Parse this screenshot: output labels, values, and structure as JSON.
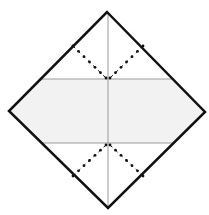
{
  "diagram": {
    "type": "origami-fold-step",
    "canvas": {
      "width": 209,
      "height": 215,
      "background": "#ffffff"
    },
    "paper": {
      "shape": "diamond",
      "corners": {
        "top": [
          107,
          12
        ],
        "right": [
          205,
          112
        ],
        "bottom": [
          108,
          208
        ],
        "left": [
          9,
          111
        ]
      },
      "outline_color": "#111111",
      "outline_width": 2.5,
      "fill_top": "#ffffff",
      "fill_band": "#f2f2f2",
      "fill_bottom": "#ffffff"
    },
    "creases": {
      "color": "#9a9a9a",
      "width": 1,
      "vertical": {
        "x": 108,
        "y1": 12,
        "y2": 208
      },
      "horizontal_top": {
        "y": 79,
        "x1": 41,
        "x2": 174
      },
      "horizontal_bottom": {
        "y": 143,
        "x1": 42,
        "x2": 174
      }
    },
    "valley_folds": {
      "color": "#111111",
      "style": "dot-dash",
      "lines": [
        {
          "name": "top-left",
          "x1": 73,
          "y1": 46,
          "x2": 106,
          "y2": 78
        },
        {
          "name": "top-right",
          "x1": 143,
          "y1": 46,
          "x2": 110,
          "y2": 78
        },
        {
          "name": "bottom-left",
          "x1": 73,
          "y1": 176,
          "x2": 106,
          "y2": 145
        },
        {
          "name": "bottom-right",
          "x1": 143,
          "y1": 176,
          "x2": 110,
          "y2": 145
        }
      ]
    },
    "labels": {
      "title": "Origami step: valley fold corners to center crease"
    }
  }
}
